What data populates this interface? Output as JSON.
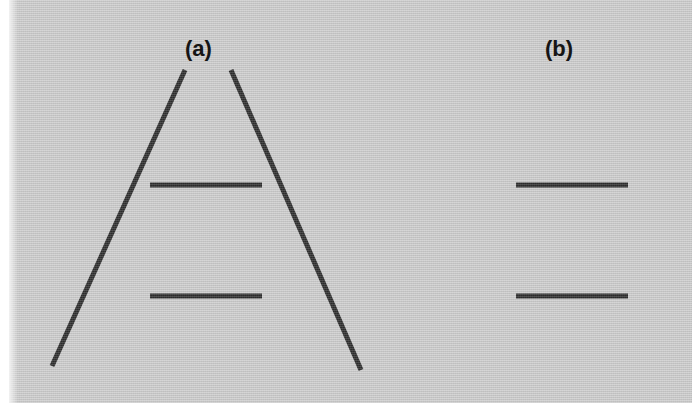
{
  "figure": {
    "width": 692,
    "height": 403,
    "background_color": "#c9c9c9",
    "ink_color": "#161616",
    "paper_margin_color": "#ffffff"
  },
  "panels": [
    {
      "id": "a",
      "label": "(a)",
      "label_position": {
        "x": 185,
        "y": 36
      },
      "description": "Two horizontal bars flanked by a pair of converging (perspective) lines forming an inverted V",
      "context_lines": [
        {
          "name": "left-converging-line",
          "x1": 185,
          "y1": 70,
          "x2": 52,
          "y2": 366,
          "stroke_width": 5
        },
        {
          "name": "right-converging-line",
          "x1": 231,
          "y1": 70,
          "x2": 361,
          "y2": 370,
          "stroke_width": 5
        }
      ],
      "bars": [
        {
          "name": "upper-bar",
          "x1": 150,
          "y1": 185,
          "x2": 262,
          "y2": 185,
          "length": 112,
          "stroke_width": 5
        },
        {
          "name": "lower-bar",
          "x1": 150,
          "y1": 296,
          "x2": 262,
          "y2": 296,
          "length": 112,
          "stroke_width": 5
        }
      ]
    },
    {
      "id": "b",
      "label": "(b)",
      "label_position": {
        "x": 545,
        "y": 36
      },
      "description": "The same two horizontal bars presented alone without converging context lines",
      "context_lines": [],
      "bars": [
        {
          "name": "upper-bar",
          "x1": 516,
          "y1": 185,
          "x2": 628,
          "y2": 185,
          "length": 112,
          "stroke_width": 5
        },
        {
          "name": "lower-bar",
          "x1": 516,
          "y1": 296,
          "x2": 628,
          "y2": 296,
          "length": 112,
          "stroke_width": 5
        }
      ]
    }
  ]
}
